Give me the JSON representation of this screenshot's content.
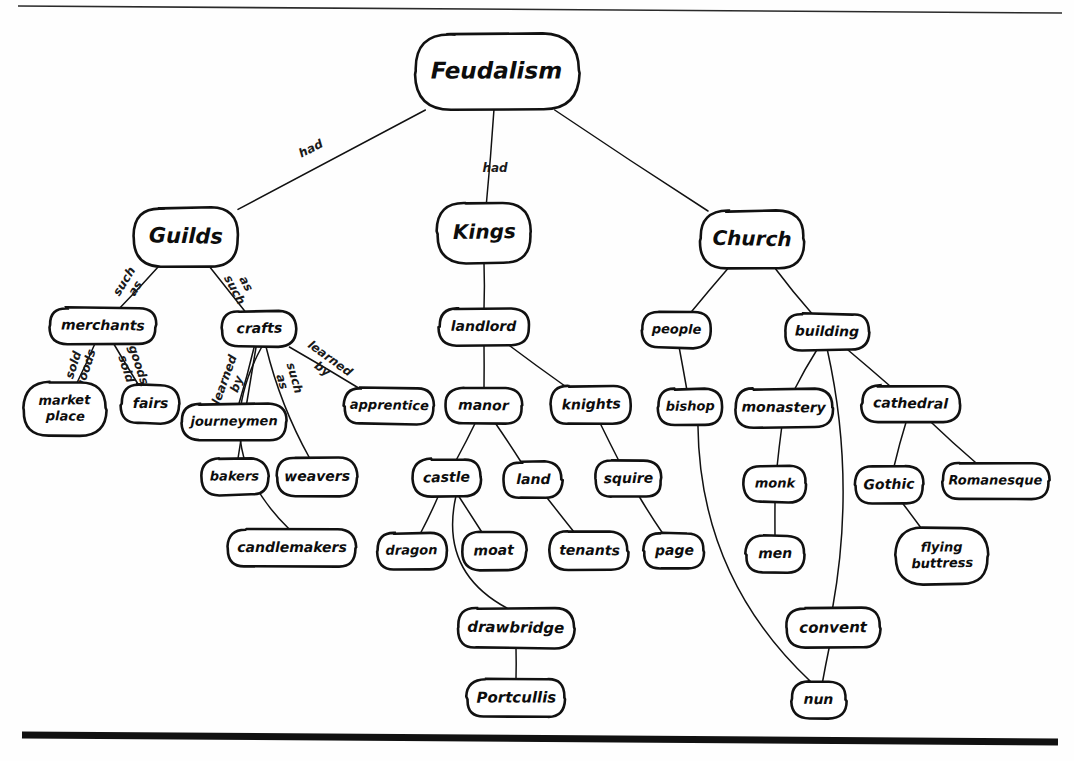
{
  "diagram": {
    "type": "concept-map",
    "title": "Feudalism",
    "style": "hand-drawn rounded-rectangle nodes with labeled link lines",
    "canvas": {
      "width": 1074,
      "height": 761
    },
    "rules": {
      "top": {
        "x1": 18,
        "y1": 6,
        "x2": 1062,
        "y2": 13
      },
      "bottom": {
        "x1": 22,
        "y1": 735,
        "x2": 1058,
        "y2": 742
      }
    },
    "nodes": [
      {
        "id": "feudalism",
        "label": "Feudalism",
        "x": 497,
        "y": 72,
        "rx": 82,
        "ry": 38,
        "fs": 23
      },
      {
        "id": "guilds",
        "label": "Guilds",
        "x": 186,
        "y": 237,
        "rx": 52,
        "ry": 29,
        "fs": 21
      },
      {
        "id": "kings",
        "label": "Kings",
        "x": 484,
        "y": 233,
        "rx": 47,
        "ry": 30,
        "fs": 20
      },
      {
        "id": "church",
        "label": "Church",
        "x": 752,
        "y": 240,
        "rx": 52,
        "ry": 29,
        "fs": 20
      },
      {
        "id": "merchants",
        "label": "merchants",
        "x": 103,
        "y": 326,
        "rx": 53,
        "ry": 18,
        "fs": 14
      },
      {
        "id": "crafts",
        "label": "crafts",
        "x": 259,
        "y": 329,
        "rx": 37,
        "ry": 18,
        "fs": 14
      },
      {
        "id": "marketplace",
        "label": "market place",
        "x": 65,
        "y": 409,
        "rx": 41,
        "ry": 27,
        "fs": 13,
        "lines": [
          "market",
          "place"
        ]
      },
      {
        "id": "fairs",
        "label": "fairs",
        "x": 150,
        "y": 404,
        "rx": 29,
        "ry": 19,
        "fs": 14
      },
      {
        "id": "journeymen",
        "label": "journeymen",
        "x": 234,
        "y": 422,
        "rx": 52,
        "ry": 18,
        "fs": 13
      },
      {
        "id": "apprentice",
        "label": "apprentice",
        "x": 389,
        "y": 406,
        "rx": 45,
        "ry": 18,
        "fs": 13
      },
      {
        "id": "bakers",
        "label": "bakers",
        "x": 235,
        "y": 477,
        "rx": 33,
        "ry": 18,
        "fs": 13
      },
      {
        "id": "weavers",
        "label": "weavers",
        "x": 317,
        "y": 477,
        "rx": 40,
        "ry": 19,
        "fs": 14
      },
      {
        "id": "candlemakers",
        "label": "candlemakers",
        "x": 292,
        "y": 548,
        "rx": 64,
        "ry": 19,
        "fs": 14
      },
      {
        "id": "landlord",
        "label": "landlord",
        "x": 484,
        "y": 327,
        "rx": 45,
        "ry": 18,
        "fs": 14
      },
      {
        "id": "manor",
        "label": "manor",
        "x": 484,
        "y": 406,
        "rx": 38,
        "ry": 18,
        "fs": 14
      },
      {
        "id": "knights",
        "label": "knights",
        "x": 591,
        "y": 405,
        "rx": 40,
        "ry": 19,
        "fs": 14
      },
      {
        "id": "castle",
        "label": "castle",
        "x": 447,
        "y": 478,
        "rx": 34,
        "ry": 19,
        "fs": 14
      },
      {
        "id": "land",
        "label": "land",
        "x": 533,
        "y": 480,
        "rx": 29,
        "ry": 18,
        "fs": 14
      },
      {
        "id": "squire",
        "label": "squire",
        "x": 628,
        "y": 479,
        "rx": 33,
        "ry": 18,
        "fs": 14
      },
      {
        "id": "dragon",
        "label": "dragon",
        "x": 412,
        "y": 551,
        "rx": 35,
        "ry": 18,
        "fs": 13
      },
      {
        "id": "moat",
        "label": "moat",
        "x": 494,
        "y": 551,
        "rx": 32,
        "ry": 19,
        "fs": 14
      },
      {
        "id": "tenants",
        "label": "tenants",
        "x": 589,
        "y": 551,
        "rx": 39,
        "ry": 19,
        "fs": 14
      },
      {
        "id": "page",
        "label": "page",
        "x": 674,
        "y": 551,
        "rx": 30,
        "ry": 18,
        "fs": 14
      },
      {
        "id": "drawbridge",
        "label": "drawbridge",
        "x": 516,
        "y": 628,
        "rx": 58,
        "ry": 20,
        "fs": 15
      },
      {
        "id": "portcullis",
        "label": "Portcullis",
        "x": 516,
        "y": 698,
        "rx": 49,
        "ry": 19,
        "fs": 15
      },
      {
        "id": "people",
        "label": "people",
        "x": 676,
        "y": 330,
        "rx": 34,
        "ry": 18,
        "fs": 13
      },
      {
        "id": "building",
        "label": "building",
        "x": 827,
        "y": 332,
        "rx": 42,
        "ry": 18,
        "fs": 14
      },
      {
        "id": "bishop",
        "label": "bishop",
        "x": 690,
        "y": 407,
        "rx": 32,
        "ry": 18,
        "fs": 13
      },
      {
        "id": "monastery",
        "label": "monastery",
        "x": 784,
        "y": 408,
        "rx": 49,
        "ry": 19,
        "fs": 14
      },
      {
        "id": "cathedral",
        "label": "cathedral",
        "x": 911,
        "y": 404,
        "rx": 49,
        "ry": 18,
        "fs": 14
      },
      {
        "id": "monk",
        "label": "monk",
        "x": 775,
        "y": 484,
        "rx": 31,
        "ry": 18,
        "fs": 13
      },
      {
        "id": "gothic",
        "label": "Gothic",
        "x": 889,
        "y": 485,
        "rx": 34,
        "ry": 19,
        "fs": 14
      },
      {
        "id": "romanesque",
        "label": "Romanesque",
        "x": 996,
        "y": 481,
        "rx": 53,
        "ry": 18,
        "fs": 13
      },
      {
        "id": "men",
        "label": "men",
        "x": 775,
        "y": 554,
        "rx": 29,
        "ry": 18,
        "fs": 14
      },
      {
        "id": "flyingbuttress",
        "label": "flying buttress",
        "x": 942,
        "y": 556,
        "rx": 46,
        "ry": 28,
        "fs": 13,
        "lines": [
          "flying",
          "buttress"
        ]
      },
      {
        "id": "convent",
        "label": "convent",
        "x": 833,
        "y": 628,
        "rx": 47,
        "ry": 20,
        "fs": 15
      },
      {
        "id": "nun",
        "label": "nun",
        "x": 819,
        "y": 700,
        "rx": 27,
        "ry": 18,
        "fs": 14
      }
    ],
    "edges": [
      {
        "from": "feudalism",
        "to": "guilds",
        "label": "had",
        "lx": 311,
        "ly": 149,
        "rot": -27
      },
      {
        "from": "feudalism",
        "to": "kings",
        "label": "had",
        "lx": 495,
        "ly": 168,
        "rot": 0
      },
      {
        "from": "feudalism",
        "to": "church",
        "label": "",
        "lx": 0,
        "ly": 0,
        "rot": 0
      },
      {
        "from": "guilds",
        "to": "merchants",
        "label": "such as",
        "lx": 130,
        "ly": 285,
        "rot": -58,
        "words": [
          "such",
          "as"
        ]
      },
      {
        "from": "guilds",
        "to": "crafts",
        "label": "such as",
        "lx": 240,
        "ly": 287,
        "rot": 62,
        "words": [
          "as",
          "such"
        ]
      },
      {
        "from": "merchants",
        "to": "marketplace",
        "label": "sold goods",
        "lx": 80,
        "ly": 367,
        "rot": -72,
        "words": [
          "sold",
          "goods"
        ]
      },
      {
        "from": "merchants",
        "to": "fairs",
        "label": "sold goods",
        "lx": 132,
        "ly": 367,
        "rot": 72,
        "words": [
          "goods",
          "sold"
        ]
      },
      {
        "from": "crafts",
        "to": "journeymen",
        "label": "learned by",
        "lx": 231,
        "ly": 382,
        "rot": -70,
        "words": [
          "learned",
          "by"
        ]
      },
      {
        "from": "crafts",
        "to": "apprentice",
        "label": "learned by",
        "lx": 326,
        "ly": 364,
        "rot": 36,
        "words": [
          "learned",
          "by"
        ]
      },
      {
        "from": "crafts",
        "to": "bakers",
        "label": "such as",
        "lx": 288,
        "ly": 380,
        "rot": 74,
        "words": [
          "such",
          "as"
        ]
      },
      {
        "from": "crafts",
        "to": "weavers",
        "label": ""
      },
      {
        "from": "crafts",
        "to": "candlemakers",
        "label": ""
      },
      {
        "from": "kings",
        "to": "landlord",
        "label": ""
      },
      {
        "from": "landlord",
        "to": "manor",
        "label": ""
      },
      {
        "from": "landlord",
        "to": "knights",
        "label": ""
      },
      {
        "from": "manor",
        "to": "castle",
        "label": ""
      },
      {
        "from": "manor",
        "to": "land",
        "label": ""
      },
      {
        "from": "knights",
        "to": "squire",
        "label": ""
      },
      {
        "from": "castle",
        "to": "dragon",
        "label": ""
      },
      {
        "from": "castle",
        "to": "moat",
        "label": ""
      },
      {
        "from": "castle",
        "to": "drawbridge",
        "label": ""
      },
      {
        "from": "land",
        "to": "tenants",
        "label": ""
      },
      {
        "from": "squire",
        "to": "page",
        "label": ""
      },
      {
        "from": "drawbridge",
        "to": "portcullis",
        "label": ""
      },
      {
        "from": "church",
        "to": "people",
        "label": ""
      },
      {
        "from": "church",
        "to": "building",
        "label": ""
      },
      {
        "from": "people",
        "to": "bishop",
        "label": ""
      },
      {
        "from": "building",
        "to": "monastery",
        "label": ""
      },
      {
        "from": "building",
        "to": "cathedral",
        "label": ""
      },
      {
        "from": "building",
        "to": "convent",
        "label": ""
      },
      {
        "from": "monastery",
        "to": "monk",
        "label": ""
      },
      {
        "from": "monk",
        "to": "men",
        "label": ""
      },
      {
        "from": "cathedral",
        "to": "gothic",
        "label": ""
      },
      {
        "from": "cathedral",
        "to": "romanesque",
        "label": ""
      },
      {
        "from": "gothic",
        "to": "flyingbuttress",
        "label": ""
      },
      {
        "from": "convent",
        "to": "nun",
        "label": ""
      },
      {
        "from": "bishop",
        "to": "nun",
        "label": ""
      }
    ],
    "colors": {
      "ink": "#111111",
      "paper": "#ffffff"
    }
  }
}
